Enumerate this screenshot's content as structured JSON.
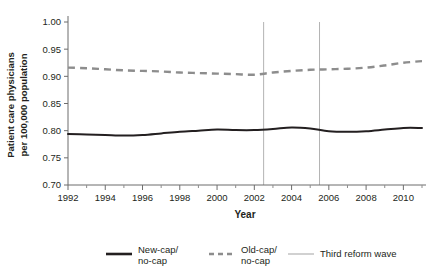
{
  "chart_data": {
    "type": "line",
    "title": "",
    "xlabel": "Year",
    "ylabel_line1": "Patient care physicians",
    "ylabel_line2": "per 100,000 population",
    "xlim": [
      1992,
      2011
    ],
    "ylim": [
      0.7,
      1.0
    ],
    "grid": false,
    "legend_position": "bottom",
    "x": [
      1992,
      1993,
      1994,
      1995,
      1996,
      1997,
      1998,
      1999,
      2000,
      2001,
      2002,
      2003,
      2004,
      2005,
      2006,
      2007,
      2008,
      2009,
      2010,
      2011
    ],
    "xticks": [
      1992,
      1994,
      1996,
      1998,
      2000,
      2002,
      2004,
      2006,
      2008,
      2010
    ],
    "xtick_labels": [
      "1992",
      "1994",
      "1996",
      "1998",
      "2000",
      "2002",
      "2004",
      "2006",
      "2008",
      "2010"
    ],
    "xminor_ticks": [
      1993,
      1995,
      1997,
      1999,
      2001,
      2003,
      2005,
      2007,
      2009,
      2011
    ],
    "yticks": [
      0.7,
      0.75,
      0.8,
      0.85,
      0.9,
      0.95,
      1.0
    ],
    "ytick_labels": [
      "0.70",
      "0.75",
      "0.80",
      "0.85",
      "0.90",
      "0.95",
      "1.00"
    ],
    "series": [
      {
        "name": "New-cap/ no-cap",
        "style": "solid",
        "color": "#231f20",
        "values": [
          0.794,
          0.793,
          0.792,
          0.791,
          0.792,
          0.795,
          0.798,
          0.8,
          0.802,
          0.801,
          0.801,
          0.803,
          0.806,
          0.804,
          0.799,
          0.798,
          0.799,
          0.802,
          0.805,
          0.805
        ]
      },
      {
        "name": "Old-cap/ no-cap",
        "style": "dashed",
        "color": "#8d8d8d",
        "values": [
          0.916,
          0.915,
          0.913,
          0.911,
          0.91,
          0.909,
          0.907,
          0.906,
          0.905,
          0.904,
          0.903,
          0.907,
          0.91,
          0.912,
          0.913,
          0.914,
          0.916,
          0.92,
          0.925,
          0.928
        ]
      }
    ],
    "annotations": [
      {
        "name": "Third reform wave",
        "type": "vline",
        "x": 2002.5,
        "color": "#b3b3b3"
      },
      {
        "name": "Third reform wave",
        "type": "vline",
        "x": 2005.5,
        "color": "#b3b3b3"
      }
    ],
    "legend": [
      {
        "label_line1": "New-cap/",
        "label_line2": "no-cap",
        "style": "solid",
        "color": "#231f20"
      },
      {
        "label_line1": "Old-cap/",
        "label_line2": "no-cap",
        "style": "dashed",
        "color": "#8d8d8d"
      },
      {
        "label_line1": "Third reform wave",
        "label_line2": "",
        "style": "thin",
        "color": "#b3b3b3"
      }
    ]
  }
}
